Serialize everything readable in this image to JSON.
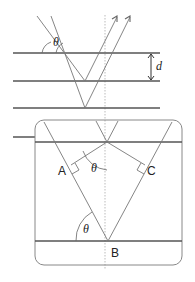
{
  "diagram": {
    "labels": {
      "theta_top": "θ",
      "spacing": "d",
      "point_a": "A",
      "point_b": "B",
      "point_c": "C",
      "theta_inner": "θ",
      "theta_bottom": "θ"
    },
    "colors": {
      "plane_line": "#555555",
      "ray_line": "#777777",
      "normal_dashed": "#aaaaaa",
      "box_border": "#888888",
      "text": "#222222"
    }
  }
}
